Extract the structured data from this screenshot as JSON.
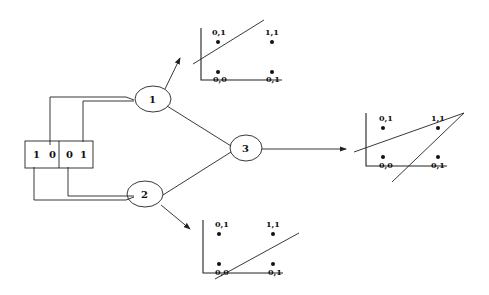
{
  "diagram": {
    "title": "",
    "input_box": {
      "cells": [
        {
          "left": "1",
          "right": "0"
        },
        {
          "left": "0",
          "right": "1"
        }
      ]
    },
    "nodes": [
      {
        "id": "1",
        "label": "1"
      },
      {
        "id": "2",
        "label": "2"
      },
      {
        "id": "3",
        "label": "3"
      }
    ],
    "plots": {
      "node1": {
        "points": [
          {
            "label": "0,1",
            "pos": "top-left"
          },
          {
            "label": "1,1",
            "pos": "top-right"
          },
          {
            "label": "0,0",
            "pos": "bottom-left"
          },
          {
            "label": "0,1",
            "pos": "bottom-right"
          }
        ]
      },
      "node2": {
        "points": [
          {
            "label": "0,1",
            "pos": "top-left"
          },
          {
            "label": "1,1",
            "pos": "top-right"
          },
          {
            "label": "0,0",
            "pos": "bottom-left"
          },
          {
            "label": "0,1",
            "pos": "bottom-right"
          }
        ]
      },
      "node3": {
        "points": [
          {
            "label": "0,1",
            "pos": "top-left"
          },
          {
            "label": "1,1",
            "pos": "top-right"
          },
          {
            "label": "0,0",
            "pos": "bottom-left"
          },
          {
            "label": "0,1",
            "pos": "bottom-right"
          }
        ]
      }
    },
    "colors": {
      "stroke": "#222222",
      "background": "#ffffff"
    }
  }
}
